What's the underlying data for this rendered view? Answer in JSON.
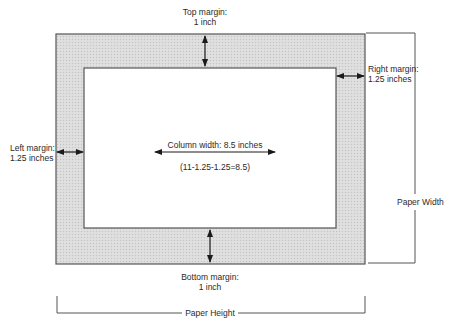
{
  "diagram": {
    "type": "page-margin-layout",
    "colors": {
      "margin_fill": "#d6d6d6",
      "outline": "#555555",
      "arrow": "#1a1a1a",
      "background": "#ffffff"
    },
    "labels": {
      "top_margin_title": "Top margin:",
      "top_margin_value": "1 inch",
      "right_margin_title": "Right margin:",
      "right_margin_value": "1.25 inches",
      "left_margin_title": "Left margin:",
      "left_margin_value": "1.25 inches",
      "bottom_margin_title": "Bottom margin:",
      "bottom_margin_value": "1 inch",
      "column_width": "Column width:  8.5 inches",
      "column_formula": "(11-1.25-1.25=8.5)",
      "paper_width": "Paper Width",
      "paper_height": "Paper Height"
    }
  }
}
